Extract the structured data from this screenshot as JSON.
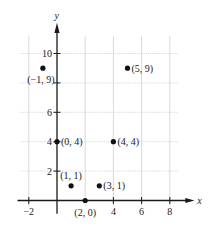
{
  "chart_data": {
    "type": "scatter",
    "title": "",
    "xlabel": "x",
    "ylabel": "y",
    "xlim": [
      -2.6,
      9.8
    ],
    "ylim": [
      -0.6,
      12
    ],
    "grid": true,
    "x_ticks": [
      -2,
      4,
      6,
      8
    ],
    "y_ticks": [
      2,
      4,
      6,
      10
    ],
    "x_tick_labels": [
      "−2",
      "4",
      "6",
      "8"
    ],
    "y_tick_labels": [
      "2",
      "4",
      "6",
      "10"
    ],
    "points": [
      {
        "x": -1,
        "y": 9,
        "label": "(−1, 9)"
      },
      {
        "x": 5,
        "y": 9,
        "label": "(5, 9)"
      },
      {
        "x": 0,
        "y": 4,
        "label": "(0, 4)"
      },
      {
        "x": 4,
        "y": 4,
        "label": "(4, 4)"
      },
      {
        "x": 1,
        "y": 1,
        "label": "(1, 1)"
      },
      {
        "x": 3,
        "y": 1,
        "label": "(3, 1)"
      },
      {
        "x": 2,
        "y": 0,
        "label": "(2, 0)"
      }
    ]
  },
  "colors": {
    "axis": "#1a1a1a",
    "grid": "#cfcfcf",
    "point": "#111111"
  }
}
